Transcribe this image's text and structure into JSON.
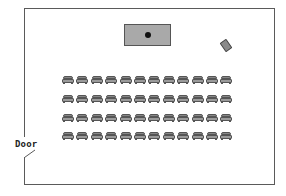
{
  "diagram": {
    "type": "classroom floor plan",
    "labels": {
      "door": "Door"
    },
    "room": {
      "wall_color": "#5a5a5a",
      "background": "#ffffff"
    },
    "front_desk": {
      "fill": "#a9a9a9",
      "has_center_dot": true
    },
    "podium": {
      "fill": "#8a8a8a",
      "orientation": "angled"
    },
    "seating": {
      "rows": 4,
      "chairs_per_row": 12,
      "total_chairs": 48,
      "chair_fill": "#9a9a9a"
    }
  }
}
